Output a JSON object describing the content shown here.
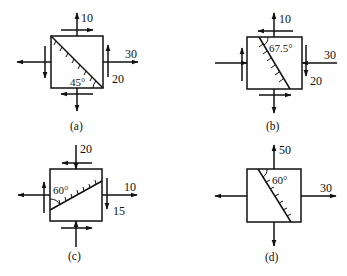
{
  "diagrams": [
    {
      "id": "a",
      "caption": "(a)",
      "angle_label": "45°",
      "labels": {
        "top_normal": "10",
        "right_normal": "30",
        "right_shear": "20"
      }
    },
    {
      "id": "b",
      "caption": "(b)",
      "angle_label": "67.5°",
      "labels": {
        "top_normal": "10",
        "right_normal": "30",
        "right_shear": "20"
      }
    },
    {
      "id": "c",
      "caption": "(c)",
      "angle_label": "60°",
      "labels": {
        "top_normal": "20",
        "right_normal": "10",
        "right_shear": "15"
      }
    },
    {
      "id": "d",
      "caption": "(d)",
      "angle_label": "60°",
      "labels": {
        "top_normal": "50",
        "right_normal": "30"
      }
    }
  ],
  "colors": {
    "stroke": "#111111",
    "background": "#ffffff"
  }
}
